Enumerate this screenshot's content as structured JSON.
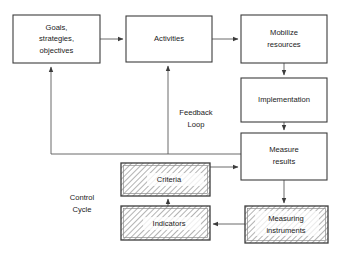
{
  "diagram": {
    "background_color": "#ffffff",
    "line_color": "#5a5a5a",
    "box_border_color": "#3c3c3c",
    "hatch_color": "#9a9a9a",
    "nodes": [
      {
        "id": "goals",
        "label_lines": [
          "Goals,",
          "strategies,",
          "objectives"
        ],
        "style": "plain",
        "x": 13,
        "y": 15,
        "w": 87,
        "h": 48
      },
      {
        "id": "activities",
        "label_lines": [
          "Activities"
        ],
        "style": "plain",
        "x": 126,
        "y": 16,
        "w": 86,
        "h": 46
      },
      {
        "id": "mobilize",
        "label_lines": [
          "Mobilize",
          "resources"
        ],
        "style": "plain",
        "x": 241,
        "y": 15,
        "w": 86,
        "h": 48
      },
      {
        "id": "implementation",
        "label_lines": [
          "Implementation"
        ],
        "style": "plain",
        "x": 241,
        "y": 78,
        "w": 86,
        "h": 44
      },
      {
        "id": "measure",
        "label_lines": [
          "Measure",
          "results"
        ],
        "style": "plain",
        "x": 241,
        "y": 133,
        "w": 86,
        "h": 47
      },
      {
        "id": "criteria",
        "label_lines": [
          "Criteria"
        ],
        "style": "hatched",
        "x": 121,
        "y": 163,
        "w": 89,
        "h": 33
      },
      {
        "id": "indicators",
        "label_lines": [
          "Indicators"
        ],
        "style": "hatched",
        "x": 121,
        "y": 206,
        "w": 89,
        "h": 34
      },
      {
        "id": "measuring-instruments",
        "label_lines": [
          "Measuring",
          "instruments"
        ],
        "style": "hatched",
        "x": 245,
        "y": 206,
        "w": 83,
        "h": 37
      }
    ],
    "free_labels": [
      {
        "id": "feedback-loop",
        "label_lines": [
          "Feedback",
          "Loop"
        ],
        "cx": 196,
        "cy": 119
      },
      {
        "id": "control-cycle",
        "label_lines": [
          "Control",
          "Cycle"
        ],
        "cx": 82,
        "cy": 204
      }
    ],
    "edges": [
      {
        "id": "goals-to-activities",
        "from": "goals",
        "to": "activities",
        "arrow": true
      },
      {
        "id": "activities-to-mobilize",
        "from": "activities",
        "to": "mobilize",
        "arrow": true
      },
      {
        "id": "mobilize-to-implementation",
        "from": "mobilize",
        "to": "implementation",
        "arrow": true
      },
      {
        "id": "implementation-to-measure",
        "from": "implementation",
        "to": "measure",
        "arrow": true
      },
      {
        "id": "measure-to-goals-feedback",
        "from": "measure",
        "to": "goals",
        "arrow": true
      },
      {
        "id": "measure-to-activities-feedback",
        "from": "measure",
        "to": "activities",
        "arrow": true
      },
      {
        "id": "measure-to-measuring-instruments",
        "from": "measure",
        "to": "measuring-instruments",
        "arrow": true
      },
      {
        "id": "measuring-instruments-to-indicators",
        "from": "measuring-instruments",
        "to": "indicators",
        "arrow": true
      },
      {
        "id": "indicators-to-criteria",
        "from": "indicators",
        "to": "criteria",
        "arrow": true
      },
      {
        "id": "criteria-to-measure",
        "from": "criteria",
        "to": "measure",
        "arrow": true
      }
    ]
  }
}
